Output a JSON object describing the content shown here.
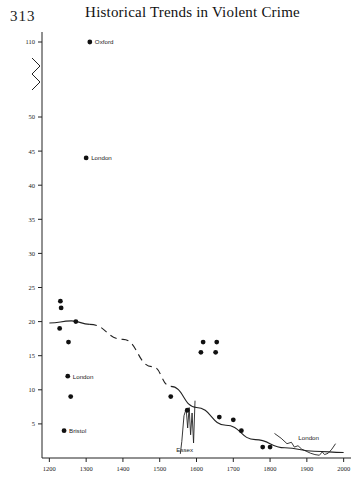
{
  "page_number": "313",
  "header": {
    "title": "Historical Trends in Violent Crime"
  },
  "chart_data": {
    "type": "scatter",
    "title": "Historical Trends in Violent Crime",
    "xlabel": "",
    "ylabel": "",
    "xlim": [
      1180,
      2020
    ],
    "ylim": [
      0,
      115
    ],
    "grid": false,
    "legend": "none",
    "y_axis_break": {
      "from": 50,
      "to": 110,
      "present": true
    },
    "xticks": [
      "1200",
      "1300",
      "1400",
      "1500",
      "1600",
      "1700",
      "1800",
      "1900",
      "2000"
    ],
    "xtick_values": [
      1200,
      1300,
      1400,
      1500,
      1600,
      1700,
      1800,
      1900,
      2000
    ],
    "yticks": [
      "110",
      "50",
      "45",
      "40",
      "35",
      "30",
      "25",
      "20",
      "15",
      "10",
      "5"
    ],
    "ytick_values": [
      110,
      50,
      45,
      40,
      35,
      30,
      25,
      20,
      15,
      10,
      5
    ],
    "points": [
      {
        "x": 1310,
        "y": 110,
        "label": "Oxford"
      },
      {
        "x": 1300,
        "y": 44,
        "label": "London"
      },
      {
        "x": 1230,
        "y": 23,
        "label": ""
      },
      {
        "x": 1232,
        "y": 22,
        "label": ""
      },
      {
        "x": 1272,
        "y": 20,
        "label": ""
      },
      {
        "x": 1228,
        "y": 19,
        "label": ""
      },
      {
        "x": 1252,
        "y": 17,
        "label": ""
      },
      {
        "x": 1250,
        "y": 12,
        "label": "London"
      },
      {
        "x": 1258,
        "y": 9,
        "label": ""
      },
      {
        "x": 1240,
        "y": 4,
        "label": "Bristol"
      },
      {
        "x": 1618,
        "y": 17,
        "label": ""
      },
      {
        "x": 1655,
        "y": 17,
        "label": ""
      },
      {
        "x": 1612,
        "y": 15.5,
        "label": ""
      },
      {
        "x": 1652,
        "y": 15.5,
        "label": ""
      },
      {
        "x": 1530,
        "y": 9,
        "label": ""
      },
      {
        "x": 1575,
        "y": 7,
        "label": ""
      },
      {
        "x": 1662,
        "y": 6,
        "label": ""
      },
      {
        "x": 1700,
        "y": 5.6,
        "label": ""
      },
      {
        "x": 1722,
        "y": 4,
        "label": ""
      },
      {
        "x": 1780,
        "y": 1.6,
        "label": ""
      },
      {
        "x": 1800,
        "y": 1.6,
        "label": ""
      }
    ],
    "series": [
      {
        "name": "overall-trend",
        "style": "solid-dashed-solid",
        "description": "Fitted long-run trend, dashed where interpolated",
        "solid_start": [
          [
            1200,
            19.8
          ],
          [
            1260,
            20.1
          ],
          [
            1310,
            19.6
          ]
        ],
        "dashed_middle": [
          [
            1310,
            19.6
          ],
          [
            1400,
            17.4
          ],
          [
            1480,
            13.4
          ],
          [
            1530,
            10.5
          ]
        ],
        "solid_end": [
          [
            1530,
            10.5
          ],
          [
            1600,
            7.4
          ],
          [
            1680,
            4.8
          ],
          [
            1760,
            2.7
          ],
          [
            1840,
            1.5
          ],
          [
            1920,
            1.0
          ],
          [
            2000,
            0.8
          ]
        ]
      },
      {
        "name": "Essex",
        "label": "Essex",
        "style": "solid",
        "description": "Short volatile series spiking around 1560-1600",
        "points": [
          [
            1556,
            0.6
          ],
          [
            1560,
            2.4
          ],
          [
            1566,
            6.2
          ],
          [
            1572,
            7.2
          ],
          [
            1576,
            4.4
          ],
          [
            1580,
            7.4
          ],
          [
            1584,
            3.4
          ],
          [
            1588,
            6.6
          ],
          [
            1592,
            2.2
          ],
          [
            1596,
            8.4
          ]
        ]
      },
      {
        "name": "London",
        "label": "London",
        "style": "solid",
        "description": "Modern London homicide series, 1810 to 1980",
        "points": [
          [
            1812,
            3.6
          ],
          [
            1830,
            2.9
          ],
          [
            1846,
            2.1
          ],
          [
            1858,
            2.3
          ],
          [
            1866,
            1.6
          ],
          [
            1876,
            1.8
          ],
          [
            1886,
            1.3
          ],
          [
            1898,
            1.0
          ],
          [
            1910,
            0.7
          ],
          [
            1922,
            0.5
          ],
          [
            1934,
            0.4
          ],
          [
            1942,
            0.9
          ],
          [
            1948,
            0.5
          ],
          [
            1958,
            0.7
          ],
          [
            1968,
            1.3
          ],
          [
            1978,
            2.1
          ]
        ]
      }
    ],
    "annotations": [
      {
        "text": "Oxford",
        "x": 1310,
        "y": 110
      },
      {
        "text": "London",
        "x": 1300,
        "y": 44
      },
      {
        "text": "London",
        "x": 1250,
        "y": 12
      },
      {
        "text": "Bristol",
        "x": 1240,
        "y": 4
      },
      {
        "text": "Essex",
        "x": 1568,
        "y": 0
      },
      {
        "text": "London",
        "x": 1905,
        "y": 2.6
      }
    ]
  }
}
